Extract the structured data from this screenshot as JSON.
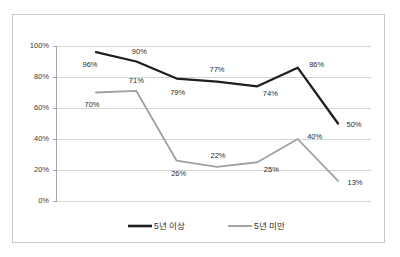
{
  "chart_data": {
    "type": "line",
    "title": "",
    "subtitle": "",
    "xlabel": "",
    "ylabel": "",
    "ylim": [
      0,
      100
    ],
    "y_ticks": [
      "0%",
      "20%",
      "40%",
      "60%",
      "80%",
      "100%"
    ],
    "y_tick_values": [
      0,
      20,
      40,
      60,
      80,
      100
    ],
    "x": [
      1,
      2,
      3,
      4,
      5,
      6,
      7
    ],
    "categories": [
      "",
      "",
      "",
      "",
      "",
      "",
      ""
    ],
    "grid": "horizontal",
    "legend_position": "bottom",
    "series": [
      {
        "name": "5년 이상",
        "color": "#1f1f1f",
        "values": [
          96,
          90,
          79,
          77,
          74,
          86,
          50
        ],
        "labels": [
          "96%",
          "90%",
          "79%",
          "77%",
          "74%",
          "86%",
          "50%"
        ],
        "label_offsets": [
          {
            "dx": -6,
            "dy": 13
          },
          {
            "dx": 3,
            "dy": -9
          },
          {
            "dx": 1,
            "dy": 14
          },
          {
            "dx": 0,
            "dy": -12
          },
          {
            "dx": 13,
            "dy": 8
          },
          {
            "dx": 19,
            "dy": -3
          },
          {
            "dx": 16,
            "dy": 2
          }
        ]
      },
      {
        "name": "5년 미만",
        "color": "#a0a0a0",
        "values": [
          70,
          71,
          26,
          22,
          25,
          40,
          13
        ],
        "labels": [
          "70%",
          "71%",
          "26%",
          "22%",
          "25%",
          "40%",
          "13%"
        ],
        "label_offsets": [
          {
            "dx": -4,
            "dy": 13
          },
          {
            "dx": 0,
            "dy": -10
          },
          {
            "dx": 2,
            "dy": 13
          },
          {
            "dx": 1,
            "dy": -11
          },
          {
            "dx": 14,
            "dy": 8
          },
          {
            "dx": 17,
            "dy": -2
          },
          {
            "dx": 17,
            "dy": 2
          }
        ]
      }
    ]
  },
  "legend": {
    "items": [
      {
        "label": "5년 이상",
        "color": "#1f1f1f"
      },
      {
        "label": "5년 미만",
        "color": "#a0a0a0"
      }
    ]
  },
  "colors": {
    "series_dark": "#1f1f1f",
    "series_gray": "#a0a0a0",
    "gridline": "#d4d4d4",
    "axis": "#a6a6a6",
    "frame_border": "#c8c8c8",
    "text": "#2c2c2c",
    "background": "#ffffff"
  }
}
